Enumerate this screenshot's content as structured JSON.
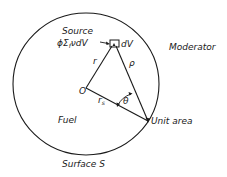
{
  "diagram": {
    "type": "geometry-schematic",
    "labels": {
      "source": "Source",
      "source_expr": "ϕΣ",
      "source_sub": "f",
      "source_tail": "νdV",
      "dv": "dV",
      "moderator": "Moderator",
      "fuel": "Fuel",
      "surface": "Surface S",
      "origin": "O",
      "r": "r",
      "rho": "ρ",
      "rs": "r",
      "rs_sub": "s",
      "theta": "θ",
      "unit_area": "Unit area"
    },
    "colors": {
      "ink": "#1a1a1a",
      "background": "#ffffff"
    },
    "geometry": {
      "boundary": {
        "cx": 86,
        "cy": 84,
        "rx": 73,
        "ry": 71
      },
      "origin": {
        "x": 86,
        "y": 88
      },
      "source_point": {
        "x": 114,
        "y": 45
      },
      "unit_area_point": {
        "x": 148,
        "y": 121
      }
    }
  }
}
